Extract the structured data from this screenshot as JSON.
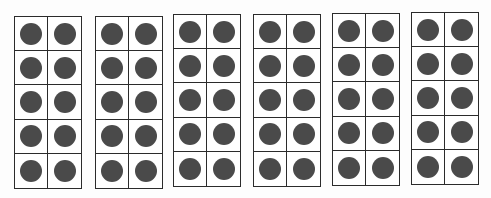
{
  "title": "",
  "figure": {
    "type": "ten-frames",
    "frame_count": 6,
    "rows_per_frame": 5,
    "cols_per_frame": 2,
    "dot_color": "#4a4a4a",
    "line_color": "#2b2b2b",
    "frames": [
      {
        "id": 1,
        "left": 14,
        "top": 16,
        "filled": 10
      },
      {
        "id": 2,
        "left": 95,
        "top": 16,
        "filled": 10
      },
      {
        "id": 3,
        "left": 173,
        "top": 14,
        "filled": 10
      },
      {
        "id": 4,
        "left": 253,
        "top": 14,
        "filled": 10
      },
      {
        "id": 5,
        "left": 332,
        "top": 13,
        "filled": 10
      },
      {
        "id": 6,
        "left": 411,
        "top": 12,
        "filled": 10
      }
    ],
    "total_dots": 60
  }
}
